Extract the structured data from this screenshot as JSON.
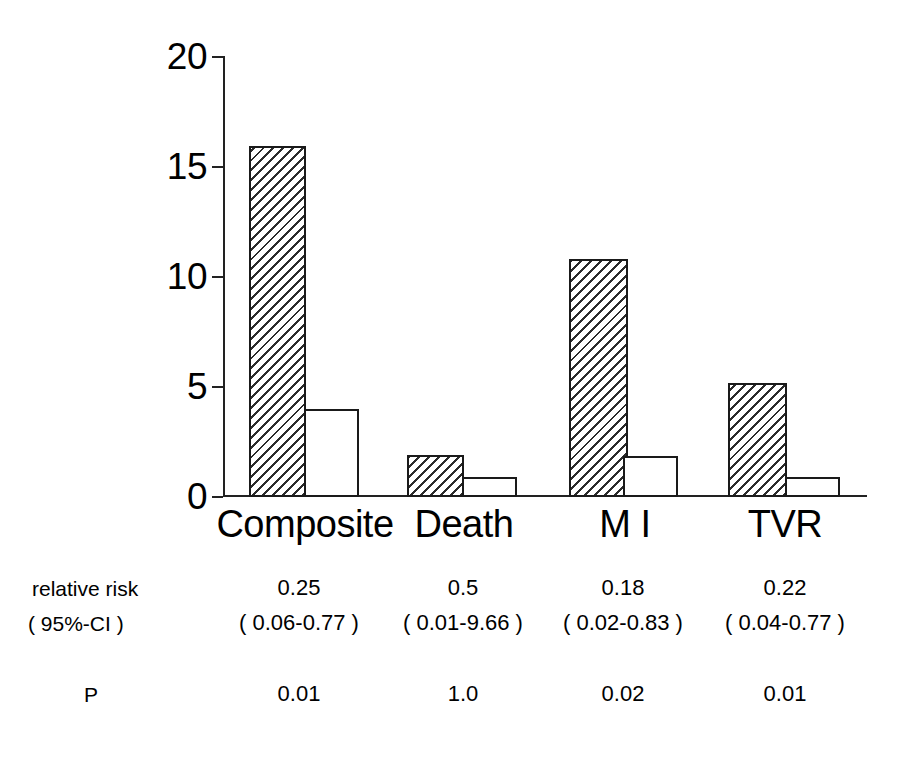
{
  "chart_data": {
    "type": "bar",
    "title": "",
    "subtitle": "",
    "xlabel": "",
    "ylabel": "",
    "ylim": [
      0,
      20
    ],
    "yticks": [
      0,
      5,
      10,
      15,
      20
    ],
    "ytick_labels": [
      "0",
      "5",
      "10",
      "15",
      "20"
    ],
    "grid": false,
    "legend": "none",
    "categories": [
      "Composite",
      "Death",
      "M I",
      "TVR"
    ],
    "series": [
      {
        "name": "treatment",
        "fill": "hatched",
        "values": [
          16.0,
          1.9,
          10.85,
          5.2
        ]
      },
      {
        "name": "control",
        "fill": "white",
        "values": [
          4.0,
          0.9,
          1.85,
          0.9
        ]
      }
    ],
    "annotations": {
      "row_labels": [
        "relative risk",
        "( 95%-CI )",
        "P"
      ],
      "relative_risk": [
        "0.25",
        "0.5",
        "0.18",
        "0.22"
      ],
      "confidence_interval": [
        "( 0.06-0.77 )",
        "( 0.01-9.66 )",
        "( 0.02-0.83 )",
        "( 0.04-0.77 )"
      ],
      "p_value": [
        "0.01",
        "1.0",
        "0.02",
        "0.01"
      ]
    },
    "colors": {
      "axis": "#222222",
      "bar_outline": "#1a1a1a",
      "hatch": "#2b2b2b",
      "background": "#ffffff"
    }
  },
  "axis": {
    "ticks": [
      {
        "label": "20",
        "value": 20
      },
      {
        "label": "15",
        "value": 15
      },
      {
        "label": "10",
        "value": 10
      },
      {
        "label": "5",
        "value": 5
      },
      {
        "label": "0",
        "value": 0
      }
    ]
  },
  "categories": [
    {
      "label": "Composite"
    },
    {
      "label": "Death"
    },
    {
      "label": "M I"
    },
    {
      "label": "TVR"
    }
  ],
  "stats": {
    "label_relative_risk": "relative risk",
    "label_ci": "( 95%-CI )",
    "label_p": "P",
    "rows": [
      {
        "relative_risk": "0.25",
        "ci": "( 0.06-0.77 )",
        "p": "0.01"
      },
      {
        "relative_risk": "0.5",
        "ci": "( 0.01-9.66 )",
        "p": "1.0"
      },
      {
        "relative_risk": "0.18",
        "ci": "( 0.02-0.83 )",
        "p": "0.02"
      },
      {
        "relative_risk": "0.22",
        "ci": "( 0.04-0.77 )",
        "p": "0.01"
      }
    ]
  }
}
